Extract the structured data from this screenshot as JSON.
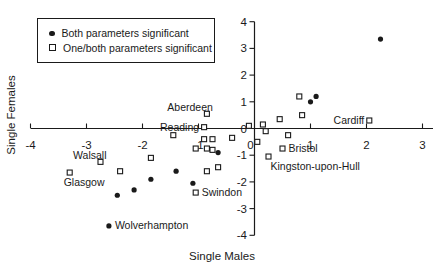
{
  "colors": {
    "ink": "#1a1a1a",
    "background": "#ffffff"
  },
  "chart_data": {
    "type": "scatter",
    "title": "",
    "xlabel": "Single Males",
    "ylabel": "Single Females",
    "xlim": [
      -4,
      3
    ],
    "ylim": [
      -4,
      4
    ],
    "x_ticks": [
      -4,
      -3,
      -2,
      -1,
      0,
      1,
      2,
      3
    ],
    "y_ticks": [
      -4,
      -3,
      -2,
      -1,
      0,
      1,
      2,
      3,
      4
    ],
    "grid": false,
    "legend_position": "top-left",
    "series": [
      {
        "name": "Both parameters significant",
        "marker": "filled-circle",
        "points": [
          {
            "x": 2.25,
            "y": 3.35
          },
          {
            "x": 1.1,
            "y": 1.2
          },
          {
            "x": 1.0,
            "y": 1.0
          },
          {
            "x": -0.65,
            "y": -0.9
          },
          {
            "x": -1.4,
            "y": -1.6
          },
          {
            "x": -1.85,
            "y": -1.9
          },
          {
            "x": -2.15,
            "y": -2.3
          },
          {
            "x": -2.45,
            "y": -2.5
          },
          {
            "x": -1.1,
            "y": -2.05
          },
          {
            "x": -2.6,
            "y": -3.65,
            "label": "Wolverhampton",
            "label_side": "right"
          }
        ]
      },
      {
        "name": "One/both parameters significant",
        "marker": "open-square",
        "points": [
          {
            "x": -0.85,
            "y": 0.55,
            "label": "Aberdeen",
            "label_side": "left-above"
          },
          {
            "x": -0.9,
            "y": 0.05,
            "label": "Reading",
            "label_side": "left"
          },
          {
            "x": 2.05,
            "y": 0.3,
            "label": "Cardiff",
            "label_side": "left"
          },
          {
            "x": 0.8,
            "y": 1.2
          },
          {
            "x": 0.85,
            "y": 0.5
          },
          {
            "x": 0.45,
            "y": 0.35
          },
          {
            "x": 0.15,
            "y": 0.15
          },
          {
            "x": -0.1,
            "y": 0.1
          },
          {
            "x": 0.2,
            "y": -0.1
          },
          {
            "x": 0.6,
            "y": -0.25
          },
          {
            "x": 0.05,
            "y": -0.5
          },
          {
            "x": 0.5,
            "y": -0.75,
            "label": "Bristol",
            "label_side": "right"
          },
          {
            "x": 0.25,
            "y": -1.05,
            "label": "Kingston-upon-Hull",
            "label_side": "below-right"
          },
          {
            "x": -0.4,
            "y": -0.35
          },
          {
            "x": -0.9,
            "y": -0.4
          },
          {
            "x": -0.75,
            "y": -0.4
          },
          {
            "x": -1.05,
            "y": -0.75
          },
          {
            "x": -0.85,
            "y": -0.75
          },
          {
            "x": -0.75,
            "y": -0.8
          },
          {
            "x": -1.45,
            "y": -0.25
          },
          {
            "x": -1.85,
            "y": -1.1
          },
          {
            "x": -0.85,
            "y": -1.6
          },
          {
            "x": -0.65,
            "y": -1.45
          },
          {
            "x": -1.05,
            "y": -2.4,
            "label": "Swindon",
            "label_side": "right"
          },
          {
            "x": -2.75,
            "y": -1.25,
            "label": "Walsall",
            "label_side": "left-above"
          },
          {
            "x": -3.3,
            "y": -1.65,
            "label": "Glasgow",
            "label_side": "below-left"
          },
          {
            "x": -2.4,
            "y": -1.6
          }
        ]
      }
    ]
  }
}
